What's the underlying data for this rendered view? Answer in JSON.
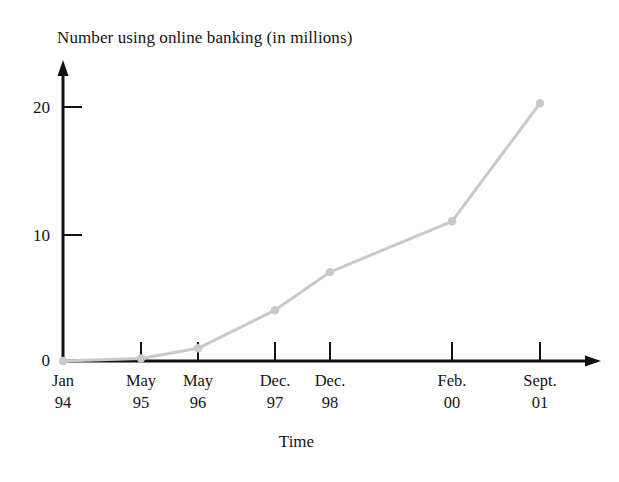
{
  "chart_data": {
    "type": "line",
    "title": "Number using online banking (in millions)",
    "xlabel": "Time",
    "ylabel": "",
    "categories": [
      "Jan 94",
      "May 95",
      "May 96",
      "Dec. 97",
      "Dec. 98",
      "Feb. 00",
      "Sept. 01"
    ],
    "category_lines": [
      {
        "line1": "Jan",
        "line2": "94"
      },
      {
        "line1": "May",
        "line2": "95"
      },
      {
        "line1": "May",
        "line2": "96"
      },
      {
        "line1": "Dec.",
        "line2": "97"
      },
      {
        "line1": "Dec.",
        "line2": "98"
      },
      {
        "line1": "Feb.",
        "line2": "00"
      },
      {
        "line1": "Sept.",
        "line2": "01"
      }
    ],
    "values": [
      0,
      0.2,
      1,
      4,
      7,
      11,
      20.3
    ],
    "ylim": [
      0,
      23.5
    ],
    "yticks": [
      0,
      10,
      20
    ],
    "ytick_labels": [
      "0",
      "10",
      "20"
    ],
    "grid": false,
    "legend": false,
    "series_color": "#c9c9c9",
    "axis_color": "#111111",
    "marker": "circle"
  },
  "figure": {
    "title": "Number using online banking (in millions)",
    "xaxis_title": "Time"
  }
}
